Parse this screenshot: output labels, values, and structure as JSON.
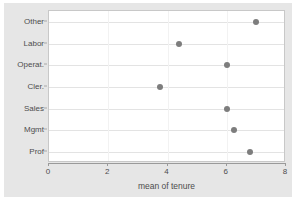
{
  "chart_data": {
    "type": "scatter",
    "title": "",
    "subtitle": "",
    "xlabel": "mean of tenure",
    "ylabel": "",
    "orientation": "horizontal",
    "grid": true,
    "legend": null,
    "xlim": [
      0,
      8
    ],
    "xticks": [
      0,
      2,
      4,
      6,
      8
    ],
    "xtick_labels": [
      "0",
      "2",
      "4",
      "6",
      "8"
    ],
    "categories": [
      "Other",
      "Labor",
      "Operat.",
      "Cler.",
      "Sales",
      "Mgmt",
      "Prof"
    ],
    "values": [
      7.0,
      4.4,
      6.0,
      3.75,
      6.0,
      6.25,
      6.8
    ],
    "points": [
      {
        "category": "Other",
        "value": 7.0
      },
      {
        "category": "Labor",
        "value": 4.4
      },
      {
        "category": "Operat.",
        "value": 6.0
      },
      {
        "category": "Cler.",
        "value": 3.75
      },
      {
        "category": "Sales",
        "value": 6.0
      },
      {
        "category": "Mgmt",
        "value": 6.25
      },
      {
        "category": "Prof",
        "value": 6.8
      }
    ],
    "marker": {
      "shape": "circle",
      "color": "#7d7d7d",
      "size_px": 6
    },
    "colors": {
      "graph_background": "#e6e6e6",
      "plot_background": "#ffffff",
      "gridline": "#e3e3e3",
      "axis": "#9a9a9a",
      "text": "#4d4d4d",
      "marker": "#7d7d7d"
    }
  }
}
